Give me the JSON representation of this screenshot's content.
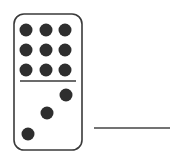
{
  "domino": {
    "top_value": 9,
    "bottom_value": 3,
    "colors": {
      "outline": "#3a3a3a",
      "pip": "#2e2e2e",
      "fill": "#ffffff"
    },
    "rect": {
      "x": 14,
      "y": 14,
      "w": 68,
      "h": 136,
      "r": 10
    },
    "divider_y": 81,
    "top_pips": [
      [
        26,
        30
      ],
      [
        46,
        30
      ],
      [
        65,
        30
      ],
      [
        26,
        50
      ],
      [
        46,
        50
      ],
      [
        65,
        50
      ],
      [
        26,
        70
      ],
      [
        46,
        70
      ],
      [
        65,
        70
      ]
    ],
    "bottom_pips": [
      [
        66,
        95
      ],
      [
        47,
        113
      ],
      [
        28,
        134
      ]
    ],
    "pip_radius": 6.5
  },
  "answer_blank": {
    "x1": 94,
    "x2": 170,
    "y": 128,
    "color": "#444444"
  }
}
